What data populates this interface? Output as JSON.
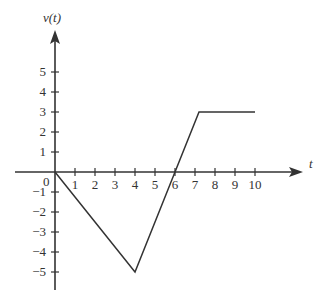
{
  "chart_data": {
    "type": "line",
    "title": "",
    "xlabel": "t",
    "ylabel": "v(t)",
    "x_ticks": [
      1,
      2,
      3,
      4,
      5,
      6,
      7,
      8,
      9,
      10
    ],
    "y_ticks": [
      5,
      4,
      3,
      2,
      1,
      -1,
      -2,
      -3,
      -4,
      -5
    ],
    "origin_label": "0",
    "xlim": [
      -2,
      12
    ],
    "ylim": [
      -6,
      7
    ],
    "grid": false,
    "legend": null,
    "series": [
      {
        "name": "v(t)",
        "x": [
          0,
          4,
          6,
          7.2,
          10
        ],
        "y": [
          0,
          -5,
          0,
          3,
          3
        ]
      }
    ]
  }
}
